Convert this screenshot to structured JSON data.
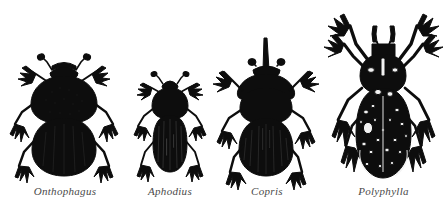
{
  "plate": {
    "title": "Scarab beetle genera comparison plate",
    "background_color": "#ffffff",
    "ink_color": "#0d0d0d",
    "label_color": "#4a4a4a",
    "width": 447,
    "height": 209
  },
  "specimens": [
    {
      "label": "Onthophagus",
      "common_group": "dung beetle",
      "silhouette": "broad oval scarab, rounded pronotum, two short clubbed antennae, six spined legs",
      "relative_size": "medium",
      "body_top": 57,
      "body_bottom": 175,
      "body_width": 62,
      "horn": "none",
      "elytra_markings": "none"
    },
    {
      "label": "Aphodius",
      "common_group": "small dung beetle",
      "silhouette": "narrow elongate cylindrical beetle, small head, striated elytra",
      "relative_size": "small",
      "body_top": 73,
      "body_bottom": 172,
      "body_width": 34,
      "horn": "none",
      "elytra_markings": "longitudinal striae"
    },
    {
      "label": "Copris",
      "common_group": "horned dung beetle",
      "silhouette": "rounded scarab with single long erect cephalic horn and flanged pronotum",
      "relative_size": "large",
      "body_top": 38,
      "body_bottom": 176,
      "body_width": 60,
      "horn": "single long vertical cephalic horn",
      "elytra_markings": "longitudinal striae"
    },
    {
      "label": "Polyphylla",
      "common_group": "ten-lined june beetle",
      "silhouette": "largest beetle, elongate oval, raised forelegs, lamellate antennae, pale speckled elytra",
      "relative_size": "largest",
      "body_top": 8,
      "body_bottom": 178,
      "body_width": 62,
      "horn": "none",
      "elytra_markings": "white scale speckles and pale stripes"
    }
  ]
}
